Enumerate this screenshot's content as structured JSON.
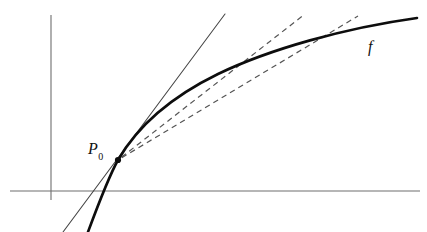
{
  "figure": {
    "background_color": "#ffffff",
    "width": 427,
    "height": 232,
    "labels": {
      "point_label": "P",
      "point_subscript": "0",
      "function_label": "f"
    },
    "colors": {
      "curve": "#0d0d0d",
      "axis": "#6e6e6e",
      "tangent": "#444444",
      "secant": "#555555",
      "point": "#0d0d0d"
    }
  },
  "chart_data": {
    "type": "line",
    "xlabel": "",
    "ylabel": "",
    "grid": false,
    "legend": null,
    "xlim": [
      0,
      427
    ],
    "ylim": [
      232,
      0
    ],
    "axes": {
      "y_axis": {
        "x": 51,
        "y_top": 15,
        "y_bottom": 200
      },
      "x_axis": {
        "y": 191,
        "x_left": 10,
        "x_right": 420
      }
    },
    "annotations": [
      {
        "text": "P",
        "subscript": "0",
        "x": 88,
        "y": 141,
        "style": "italic-serif"
      },
      {
        "text": "f",
        "x": 368,
        "y": 39,
        "style": "italic-serif"
      }
    ],
    "series": [
      {
        "name": "f",
        "style": "solid",
        "width": 2.6,
        "path": "M 88 232 C 98 205, 108 178, 118 160 C 140 122, 175 95, 218 74 C 270 49, 345 28, 417 18"
      },
      {
        "name": "tangent-at-P0",
        "style": "solid",
        "width": 1.05,
        "x1": 63,
        "y1": 232,
        "x2": 225,
        "y2": 14
      },
      {
        "name": "secant-1",
        "style": "dashed",
        "width": 1.2,
        "x1": 118,
        "y1": 160,
        "x2": 305,
        "y2": 14,
        "touch_point": {
          "x": 218,
          "y": 74
        }
      },
      {
        "name": "secant-2",
        "style": "dashed",
        "width": 1.2,
        "x1": 118,
        "y1": 160,
        "x2": 358,
        "y2": 16,
        "touch_point": {
          "x": 310,
          "y": 45
        }
      }
    ],
    "points": [
      {
        "name": "P0",
        "x": 118,
        "y": 160,
        "radius": 3.1
      }
    ]
  }
}
